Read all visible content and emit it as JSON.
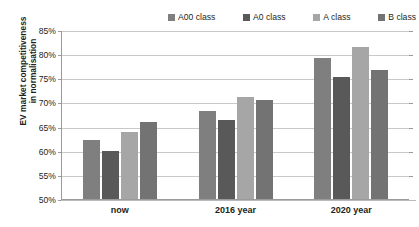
{
  "top_partial_text": "",
  "legend": {
    "position": "top",
    "items": [
      {
        "label": "A00 class",
        "color": "#7f7f7f"
      },
      {
        "label": "A0 class",
        "color": "#595959"
      },
      {
        "label": "A class",
        "color": "#a6a6a6"
      },
      {
        "label": "B class",
        "color": "#737373"
      }
    ]
  },
  "axis": {
    "y_title_line1": "EV market competitiveness",
    "y_title_line2": "in normalisation",
    "y_ticks": [
      "85%",
      "80%",
      "75%",
      "70%",
      "65%",
      "60%",
      "55%",
      "50%"
    ],
    "x_ticks": [
      "now",
      "2016 year",
      "2020 year"
    ]
  },
  "chart_data": {
    "type": "bar",
    "title": "",
    "xlabel": "",
    "ylabel": "EV market competitiveness in normalisation",
    "categories": [
      "now",
      "2016 year",
      "2020 year"
    ],
    "series": [
      {
        "name": "A00 class",
        "color": "#7f7f7f",
        "values": [
          62.2,
          68.3,
          79.2
        ]
      },
      {
        "name": "A0 class",
        "color": "#595959",
        "values": [
          60.0,
          66.3,
          75.2
        ]
      },
      {
        "name": "A class",
        "color": "#a6a6a6",
        "values": [
          63.8,
          71.2,
          81.4
        ]
      },
      {
        "name": "B class",
        "color": "#737373",
        "values": [
          65.9,
          70.5,
          76.8
        ]
      }
    ],
    "ylim": [
      50,
      85
    ],
    "ytick_step": 5,
    "ytick_format": "percent",
    "grid": true,
    "legend_position": "top"
  }
}
